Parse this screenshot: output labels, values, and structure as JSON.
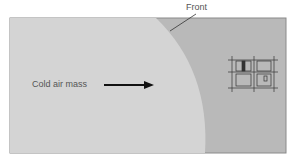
{
  "diagram": {
    "labels": {
      "front": "Front",
      "air_mass": "Cold air mass"
    },
    "colors": {
      "cold_region": "#d4d4d4",
      "warm_region": "#b9b9b9",
      "border": "#8a8a8a",
      "arrow": "#111111"
    },
    "icons": [
      "arrow-right-icon",
      "city-map-icon"
    ]
  }
}
